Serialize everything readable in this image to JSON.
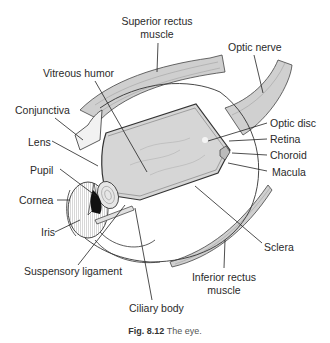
{
  "figure": {
    "caption_number": "Fig. 8.12",
    "caption_text": "The eye."
  },
  "labels": {
    "superior_rectus_line1": "Superior rectus",
    "superior_rectus_line2": "muscle",
    "optic_nerve": "Optic nerve",
    "vitreous_humor": "Vitreous humor",
    "conjunctiva": "Conjunctiva",
    "lens": "Lens",
    "pupil": "Pupil",
    "cornea": "Cornea",
    "iris": "Iris",
    "suspensory_ligament": "Suspensory ligament",
    "ciliary_body": "Ciliary body",
    "optic_disc": "Optic disc",
    "retina": "Retina",
    "choroid": "Choroid",
    "macula": "Macula",
    "sclera": "Sclera",
    "inferior_rectus_line1": "Inferior rectus",
    "inferior_rectus_line2": "muscle"
  },
  "colors": {
    "line": "#222222",
    "vitreous_fill": "#d6d6d6",
    "muscle_fill": "#c8c8c8",
    "pupil_fill": "#111111"
  }
}
